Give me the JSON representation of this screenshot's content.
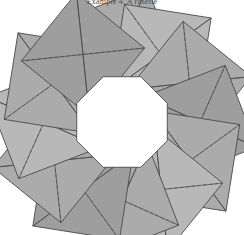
{
  "caption": {
    "text": "Example 4.  A rosette"
  },
  "figure": {
    "canvas": {
      "width": 244,
      "height": 235
    },
    "center": {
      "x": 122,
      "y": 122
    },
    "colors": {
      "background": "#ffffff",
      "fill": "#ababab",
      "fill_light": "#b8b8b8",
      "fill_dark": "#9e9e9e",
      "stroke": "#4a4a4a",
      "dashed_stroke": "#5a5a5a",
      "hole": "#ffffff"
    },
    "counts": {
      "squares": 12,
      "outer_points": 12,
      "hole_sides": 8
    },
    "geometry": {
      "square_half_diagonal": 62,
      "ring_radius": 78,
      "square_rotation_offset_deg": 24,
      "angular_step_deg": 30,
      "hole_radius": 49,
      "hole_rotation_deg": 22.5
    },
    "stroke_widths": {
      "outline": 0.9,
      "diagonal": 0.8,
      "dashed": 0.8
    },
    "dash_pattern": "3.2 2.6"
  }
}
